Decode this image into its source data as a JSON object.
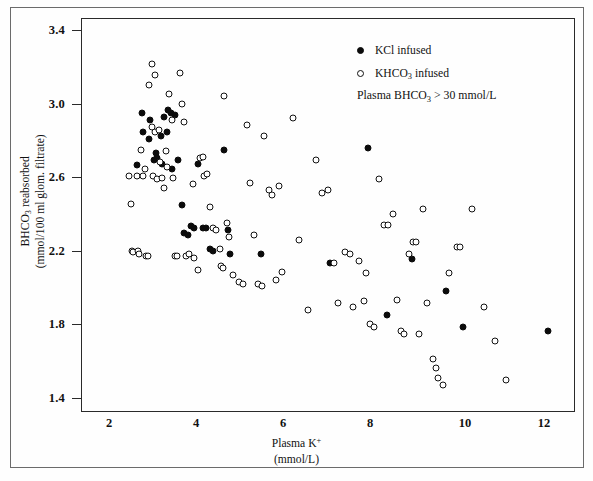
{
  "chart_data": {
    "type": "scatter",
    "title": "",
    "xlabel": "Plasma K+ (mmol/L)",
    "ylabel": "BHCO3 reabsorbed (mmol/100 ml glom. filtrate)",
    "xlabel_main": "Plasma K",
    "xlabel_sup": "+",
    "xlabel_units": "(mmol/L)",
    "ylabel_line1_pre": "BHCO",
    "ylabel_line1_sub": "3",
    "ylabel_line1_post": " reabsorbed",
    "ylabel_line2": "(mmol/100 ml glom. filtrate)",
    "xlim": [
      1.24,
      12.58
    ],
    "ylim": [
      1.275,
      3.535
    ],
    "xticks": [
      2,
      4,
      6,
      8,
      10,
      12
    ],
    "yticks": [
      3.4,
      3.0,
      2.6,
      2.2,
      1.8,
      1.4
    ],
    "ytick_labels": [
      "3.4",
      "3.0",
      "2.6",
      "2.2",
      "1.8",
      "1.4"
    ],
    "xtick_labels": [
      "2",
      "4",
      "6",
      "8",
      "10",
      "12"
    ],
    "grid": false,
    "legend_position": "top-right",
    "annotation": "Plasma BHCO3 > 30 mmol/L",
    "series": [
      {
        "name": "KCl infused",
        "marker": "filled-circle",
        "color": "#0b0b0b",
        "points": [
          [
            2.52,
            2.69
          ],
          [
            2.63,
            2.99
          ],
          [
            2.66,
            2.88
          ],
          [
            2.81,
            2.84
          ],
          [
            2.83,
            2.95
          ],
          [
            2.91,
            2.72
          ],
          [
            2.96,
            2.76
          ],
          [
            2.99,
            2.73
          ],
          [
            3.07,
            2.86
          ],
          [
            3.1,
            2.7
          ],
          [
            3.14,
            2.97
          ],
          [
            3.21,
            2.88
          ],
          [
            3.24,
            3.01
          ],
          [
            3.3,
            2.99
          ],
          [
            3.33,
            2.67
          ],
          [
            3.39,
            2.98
          ],
          [
            3.46,
            2.72
          ],
          [
            3.55,
            2.46
          ],
          [
            3.61,
            2.3
          ],
          [
            3.7,
            2.29
          ],
          [
            3.76,
            2.34
          ],
          [
            3.84,
            2.33
          ],
          [
            3.92,
            2.7
          ],
          [
            4.03,
            2.33
          ],
          [
            4.11,
            2.33
          ],
          [
            4.19,
            2.21
          ],
          [
            4.26,
            2.2
          ],
          [
            4.53,
            2.78
          ],
          [
            4.62,
            2.32
          ],
          [
            4.66,
            2.18
          ],
          [
            5.37,
            2.18
          ],
          [
            6.95,
            2.13
          ],
          [
            7.82,
            2.79
          ],
          [
            8.27,
            1.83
          ],
          [
            8.84,
            2.15
          ],
          [
            9.63,
            1.97
          ],
          [
            10.02,
            1.76
          ],
          [
            11.97,
            1.74
          ]
        ]
      },
      {
        "name": "KHCO3 infused",
        "marker": "open-circle",
        "color": "#ffffff",
        "points": [
          [
            2.34,
            2.63
          ],
          [
            2.39,
            2.47
          ],
          [
            2.42,
            2.2
          ],
          [
            2.44,
            2.19
          ],
          [
            2.52,
            2.63
          ],
          [
            2.55,
            2.2
          ],
          [
            2.58,
            2.18
          ],
          [
            2.62,
            2.78
          ],
          [
            2.66,
            2.63
          ],
          [
            2.72,
            2.67
          ],
          [
            2.74,
            2.17
          ],
          [
            2.78,
            2.17
          ],
          [
            2.8,
            3.15
          ],
          [
            2.86,
            3.27
          ],
          [
            2.88,
            2.91
          ],
          [
            2.9,
            2.63
          ],
          [
            2.93,
            2.88
          ],
          [
            2.95,
            3.21
          ],
          [
            2.99,
            2.61
          ],
          [
            3.03,
            2.89
          ],
          [
            3.06,
            2.71
          ],
          [
            3.1,
            2.62
          ],
          [
            3.14,
            2.56
          ],
          [
            3.18,
            2.77
          ],
          [
            3.22,
            2.68
          ],
          [
            3.27,
            3.1
          ],
          [
            3.33,
            2.95
          ],
          [
            3.36,
            2.62
          ],
          [
            3.4,
            2.17
          ],
          [
            3.45,
            2.17
          ],
          [
            3.52,
            3.22
          ],
          [
            3.56,
            3.04
          ],
          [
            3.6,
            2.94
          ],
          [
            3.66,
            2.17
          ],
          [
            3.72,
            2.18
          ],
          [
            3.8,
            2.58
          ],
          [
            3.84,
            2.16
          ],
          [
            3.92,
            2.09
          ],
          [
            3.98,
            2.73
          ],
          [
            4.04,
            2.74
          ],
          [
            4.07,
            2.63
          ],
          [
            4.13,
            2.64
          ],
          [
            4.2,
            2.45
          ],
          [
            4.28,
            2.33
          ],
          [
            4.34,
            2.32
          ],
          [
            4.43,
            2.21
          ],
          [
            4.46,
            2.11
          ],
          [
            4.5,
            2.1
          ],
          [
            4.53,
            3.09
          ],
          [
            4.58,
            2.36
          ],
          [
            4.64,
            2.28
          ],
          [
            4.74,
            2.06
          ],
          [
            4.86,
            2.02
          ],
          [
            4.97,
            2.01
          ],
          [
            5.06,
            2.92
          ],
          [
            5.13,
            2.59
          ],
          [
            5.21,
            2.29
          ],
          [
            5.3,
            2.01
          ],
          [
            5.39,
            2.0
          ],
          [
            5.45,
            2.86
          ],
          [
            5.55,
            2.55
          ],
          [
            5.62,
            2.52
          ],
          [
            5.71,
            2.03
          ],
          [
            5.78,
            2.57
          ],
          [
            5.86,
            2.08
          ],
          [
            6.11,
            2.96
          ],
          [
            6.25,
            2.26
          ],
          [
            6.46,
            1.86
          ],
          [
            6.63,
            2.72
          ],
          [
            6.77,
            2.53
          ],
          [
            6.92,
            2.55
          ],
          [
            7.05,
            2.13
          ],
          [
            7.15,
            1.9
          ],
          [
            7.29,
            2.19
          ],
          [
            7.42,
            2.18
          ],
          [
            7.48,
            1.88
          ],
          [
            7.62,
            2.14
          ],
          [
            7.73,
            1.91
          ],
          [
            7.79,
            2.07
          ],
          [
            7.88,
            1.78
          ],
          [
            7.97,
            1.76
          ],
          [
            8.08,
            2.61
          ],
          [
            8.19,
            2.35
          ],
          [
            8.28,
            2.35
          ],
          [
            8.4,
            2.41
          ],
          [
            8.49,
            1.92
          ],
          [
            8.58,
            1.74
          ],
          [
            8.66,
            1.72
          ],
          [
            8.77,
            2.18
          ],
          [
            8.85,
            2.25
          ],
          [
            8.93,
            2.25
          ],
          [
            9.0,
            1.72
          ],
          [
            9.08,
            2.44
          ],
          [
            9.19,
            1.9
          ],
          [
            9.33,
            1.58
          ],
          [
            9.38,
            1.53
          ],
          [
            9.44,
            1.47
          ],
          [
            9.56,
            1.43
          ],
          [
            9.69,
            2.07
          ],
          [
            9.88,
            2.22
          ],
          [
            9.95,
            2.22
          ],
          [
            10.21,
            2.44
          ],
          [
            10.48,
            1.88
          ],
          [
            10.74,
            1.68
          ],
          [
            10.99,
            1.46
          ]
        ]
      }
    ]
  },
  "legend": {
    "items": [
      {
        "label": "KCl infused",
        "marker": "filled-circle"
      },
      {
        "label_pre": "KHCO",
        "label_sub": "3",
        "label_post": " infused",
        "marker": "open-circle"
      }
    ],
    "note_pre": "Plasma BHCO",
    "note_sub": "3",
    "note_post": " > 30 mmol/L"
  }
}
